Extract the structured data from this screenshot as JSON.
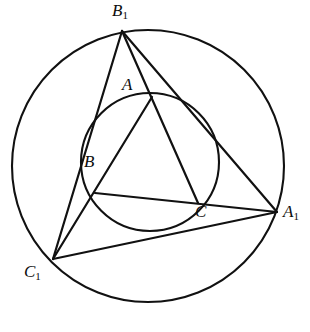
{
  "figure": {
    "background_color": "#ffffff",
    "stroke_color": "#111111",
    "label_color": "#0d0d0d"
  },
  "labels": {
    "B1": {
      "base": "B",
      "sub": "1",
      "x": 112,
      "y": 2
    },
    "A": {
      "base": "A",
      "sub": "",
      "x": 122,
      "y": 76
    },
    "B": {
      "base": "B",
      "sub": "",
      "x": 84,
      "y": 153
    },
    "C": {
      "base": "C",
      "sub": "",
      "x": 195,
      "y": 203
    },
    "A1": {
      "base": "A",
      "sub": "1",
      "x": 283,
      "y": 203
    },
    "C1": {
      "base": "C",
      "sub": "1",
      "x": 24,
      "y": 263
    }
  },
  "circles": [
    {
      "name": "circumcircle",
      "cx": 148,
      "cy": 166,
      "r": 136,
      "stroke_width": 2.1
    },
    {
      "name": "inner-circle",
      "cx": 150,
      "cy": 162,
      "r": 69,
      "stroke_width": 2.1
    }
  ],
  "points": {
    "B1": {
      "x": 122,
      "y": 31
    },
    "A": {
      "x": 152,
      "y": 97
    },
    "B": {
      "x": 95,
      "y": 193
    },
    "C": {
      "x": 198,
      "y": 203
    },
    "A1": {
      "x": 277,
      "y": 212
    },
    "C1": {
      "x": 53,
      "y": 259
    }
  },
  "segments": [
    {
      "name": "side-B1-C1",
      "from": "B1",
      "to": "C1"
    },
    {
      "name": "side-B1-A1",
      "from": "B1",
      "to": "A1"
    },
    {
      "name": "side-C1-A1",
      "from": "C1",
      "to": "A1"
    },
    {
      "name": "cevian-B1-C",
      "from": "B1",
      "to": "C"
    },
    {
      "name": "cevian-C1-A",
      "from": "C1",
      "to": "A"
    },
    {
      "name": "cevian-A1-B",
      "from": "A1",
      "to": "B"
    }
  ]
}
